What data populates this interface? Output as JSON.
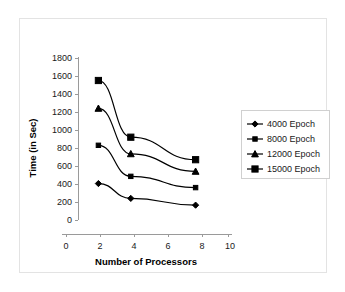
{
  "chart_data": {
    "type": "line",
    "title": "",
    "xlabel": "Number of Processors",
    "ylabel": "Time (in Sec)",
    "x": [
      2,
      4,
      8
    ],
    "xlim": [
      0,
      10
    ],
    "ylim": [
      0,
      1800
    ],
    "xticks": [
      0,
      2,
      4,
      6,
      8,
      10
    ],
    "yticks": [
      0,
      200,
      400,
      600,
      800,
      1000,
      1200,
      1400,
      1600,
      1800
    ],
    "grid": false,
    "legend_position": "right",
    "series": [
      {
        "name": "4000 Epoch",
        "marker": "diamond",
        "color": "#000000",
        "values": [
          405,
          240,
          165
        ]
      },
      {
        "name": "8000 Epoch",
        "marker": "square",
        "color": "#000000",
        "values": [
          830,
          485,
          360
        ]
      },
      {
        "name": "12000 Epoch",
        "marker": "triangle",
        "color": "#000000",
        "values": [
          1240,
          735,
          540
        ]
      },
      {
        "name": "15000 Epoch",
        "marker": "square-large",
        "color": "#000000",
        "values": [
          1550,
          920,
          670
        ]
      }
    ]
  },
  "axes": {
    "xlabel": "Number of Processors",
    "ylabel": "Time (in Sec)",
    "xticklabels": [
      "0",
      "2",
      "4",
      "6",
      "8",
      "10"
    ],
    "yticklabels": [
      "0",
      "200",
      "400",
      "600",
      "800",
      "1000",
      "1200",
      "1400",
      "1600",
      "1800"
    ]
  },
  "legend": {
    "items": [
      {
        "label": "4000 Epoch"
      },
      {
        "label": "8000 Epoch"
      },
      {
        "label": "12000 Epoch"
      },
      {
        "label": "15000 Epoch"
      }
    ]
  }
}
